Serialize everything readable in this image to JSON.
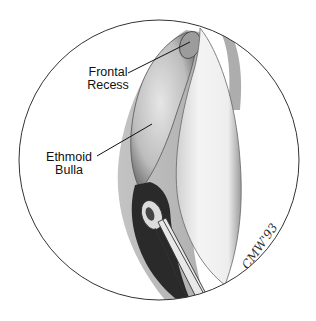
{
  "figure": {
    "type": "endoscopic anatomical illustration",
    "labels": [
      {
        "id": "frontal-recess",
        "line1": "Frontal",
        "line2": "Recess"
      },
      {
        "id": "ethmoid-bulla",
        "line1": "Ethmoid",
        "line2": "Bulla"
      }
    ],
    "signature": "CMW'93",
    "colors": {
      "background": "#ffffff",
      "circle_outline": "#333333",
      "tissue_light": "#e8e8e8",
      "tissue_mid": "#b5b5b5",
      "tissue_dark": "#2a2a2a",
      "label_text": "#111111"
    }
  }
}
